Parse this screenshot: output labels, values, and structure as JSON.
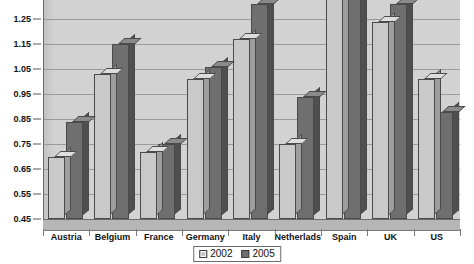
{
  "chart_data": {
    "type": "bar",
    "title": "",
    "subtitle": "",
    "xlabel": "",
    "ylabel": "",
    "ylim": [
      0.45,
      1.35
    ],
    "ytick_step": 0.1,
    "yticks": [
      "1.25",
      "1.15",
      "1.05",
      "0.95",
      "0.85",
      "0.75",
      "0.65",
      "0.55",
      "0.45"
    ],
    "grid": true,
    "legend_position": "bottom",
    "style": "3d-grouped-columns",
    "note": "Top of plot area is cropped in the screenshot; Spain bars are clipped.",
    "categories": [
      "Austria",
      "Belgium",
      "France",
      "Germany",
      "Italy",
      "Netherlads",
      "Spain",
      "UK",
      "US"
    ],
    "series": [
      {
        "name": "2002",
        "color": "#c9c9c9",
        "values": [
          0.7,
          1.03,
          0.72,
          1.01,
          1.17,
          0.75,
          1.33,
          1.24,
          1.01
        ]
      },
      {
        "name": "2005",
        "color": "#6f6f6f",
        "values": [
          0.84,
          1.15,
          0.75,
          1.06,
          1.31,
          0.94,
          1.33,
          1.31,
          0.88
        ]
      }
    ],
    "colors": {
      "series_2002": "#c9c9c9",
      "series_2005": "#6f6f6f",
      "plot_background": "#d2d2d2",
      "gridline": "#9a9a9a",
      "axis": "#6b6b6b",
      "floor": "#b6b6b6",
      "text": "#111111"
    }
  },
  "legend": {
    "entries": [
      {
        "label": "2002"
      },
      {
        "label": "2005"
      }
    ]
  }
}
